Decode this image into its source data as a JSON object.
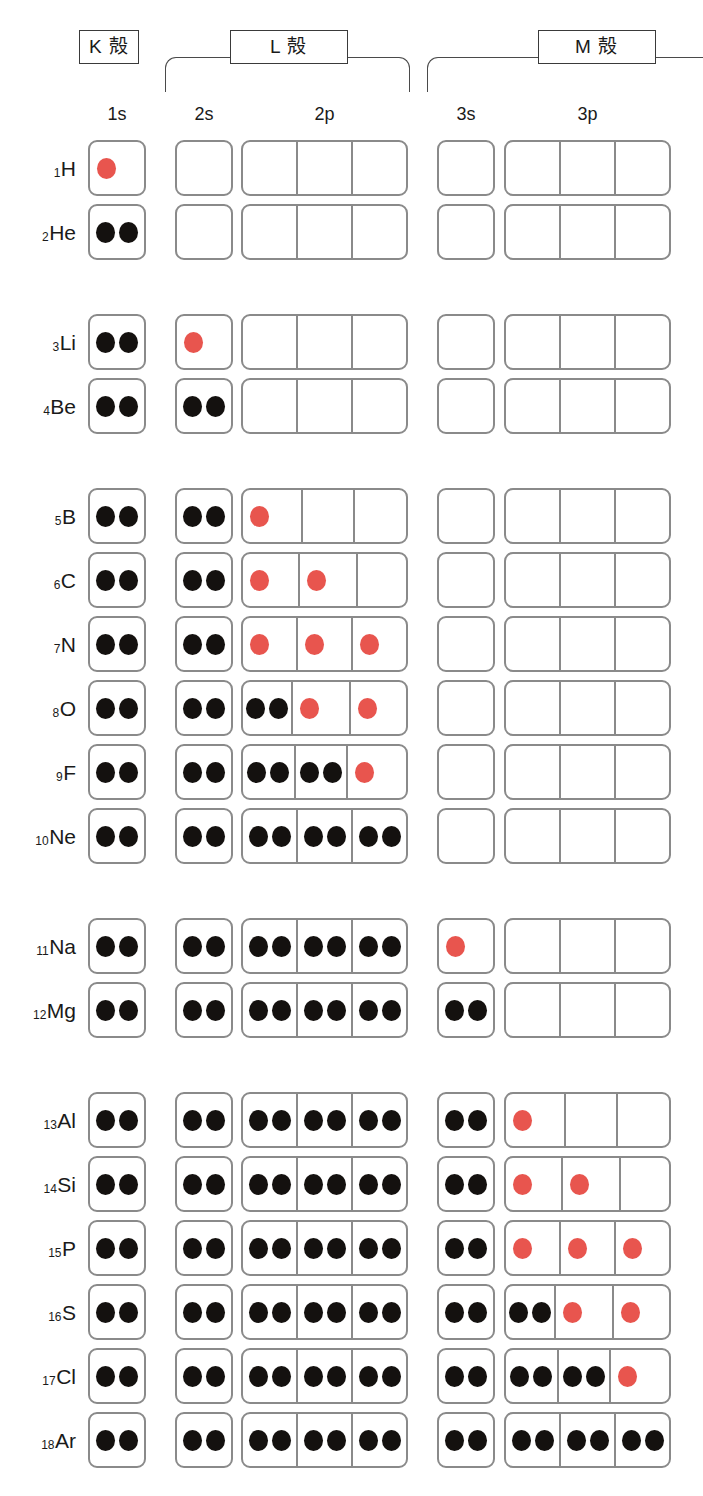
{
  "shells": [
    {
      "id": "k",
      "label": "K 殻",
      "bracket": "none"
    },
    {
      "id": "l",
      "label": "L 殻",
      "bracket": "closed"
    },
    {
      "id": "m",
      "label": "M 殻",
      "bracket": "open-right"
    }
  ],
  "orbitals": [
    {
      "id": "1s",
      "label": "1s",
      "cells": 1
    },
    {
      "id": "2s",
      "label": "2s",
      "cells": 1
    },
    {
      "id": "2p",
      "label": "2p",
      "cells": 3
    },
    {
      "id": "3s",
      "label": "3s",
      "cells": 1
    },
    {
      "id": "3p",
      "label": "3p",
      "cells": 3
    }
  ],
  "colors": {
    "paired_electron": "#14110f",
    "unpaired_electron": "#e8554e",
    "box_border": "#8a8a8a",
    "bracket": "#4a4a4a",
    "label_border": "#3a3a3a",
    "background": "#ffffff"
  },
  "legend": {
    "paired_meaning": "paired electron",
    "unpaired_meaning": "unpaired electron"
  },
  "chart_data": {
    "type": "table",
    "title": "",
    "columns": [
      "1s",
      "2s",
      "2p",
      "3s",
      "3p"
    ],
    "shell_groups": [
      "K 殻",
      "L 殻",
      "M 殻"
    ],
    "electron_states": [
      "paired",
      "unpaired",
      "empty"
    ],
    "rows": [
      {
        "z": "1",
        "symbol": "H",
        "period": 1,
        "orb": {
          "1s": [
            "unpaired"
          ],
          "2s": [],
          "2p": [
            [],
            [],
            []
          ],
          "3s": [],
          "3p": [
            [],
            [],
            []
          ]
        }
      },
      {
        "z": "2",
        "symbol": "He",
        "period": 1,
        "orb": {
          "1s": [
            "paired",
            "paired"
          ],
          "2s": [],
          "2p": [
            [],
            [],
            []
          ],
          "3s": [],
          "3p": [
            [],
            [],
            []
          ]
        }
      },
      {
        "z": "3",
        "symbol": "Li",
        "period": 2,
        "orb": {
          "1s": [
            "paired",
            "paired"
          ],
          "2s": [
            "unpaired"
          ],
          "2p": [
            [],
            [],
            []
          ],
          "3s": [],
          "3p": [
            [],
            [],
            []
          ]
        }
      },
      {
        "z": "4",
        "symbol": "Be",
        "period": 2,
        "orb": {
          "1s": [
            "paired",
            "paired"
          ],
          "2s": [
            "paired",
            "paired"
          ],
          "2p": [
            [],
            [],
            []
          ],
          "3s": [],
          "3p": [
            [],
            [],
            []
          ]
        }
      },
      {
        "z": "5",
        "symbol": "B",
        "period": 3,
        "orb": {
          "1s": [
            "paired",
            "paired"
          ],
          "2s": [
            "paired",
            "paired"
          ],
          "2p": [
            [
              "unpaired"
            ],
            [],
            []
          ],
          "3s": [],
          "3p": [
            [],
            [],
            []
          ]
        }
      },
      {
        "z": "6",
        "symbol": "C",
        "period": 3,
        "orb": {
          "1s": [
            "paired",
            "paired"
          ],
          "2s": [
            "paired",
            "paired"
          ],
          "2p": [
            [
              "unpaired"
            ],
            [
              "unpaired"
            ],
            []
          ],
          "3s": [],
          "3p": [
            [],
            [],
            []
          ]
        }
      },
      {
        "z": "7",
        "symbol": "N",
        "period": 3,
        "orb": {
          "1s": [
            "paired",
            "paired"
          ],
          "2s": [
            "paired",
            "paired"
          ],
          "2p": [
            [
              "unpaired"
            ],
            [
              "unpaired"
            ],
            [
              "unpaired"
            ]
          ],
          "3s": [],
          "3p": [
            [],
            [],
            []
          ]
        }
      },
      {
        "z": "8",
        "symbol": "O",
        "period": 3,
        "orb": {
          "1s": [
            "paired",
            "paired"
          ],
          "2s": [
            "paired",
            "paired"
          ],
          "2p": [
            [
              "paired",
              "paired"
            ],
            [
              "unpaired"
            ],
            [
              "unpaired"
            ]
          ],
          "3s": [],
          "3p": [
            [],
            [],
            []
          ]
        }
      },
      {
        "z": "9",
        "symbol": "F",
        "period": 3,
        "orb": {
          "1s": [
            "paired",
            "paired"
          ],
          "2s": [
            "paired",
            "paired"
          ],
          "2p": [
            [
              "paired",
              "paired"
            ],
            [
              "paired",
              "paired"
            ],
            [
              "unpaired"
            ]
          ],
          "3s": [],
          "3p": [
            [],
            [],
            []
          ]
        }
      },
      {
        "z": "10",
        "symbol": "Ne",
        "period": 3,
        "orb": {
          "1s": [
            "paired",
            "paired"
          ],
          "2s": [
            "paired",
            "paired"
          ],
          "2p": [
            [
              "paired",
              "paired"
            ],
            [
              "paired",
              "paired"
            ],
            [
              "paired",
              "paired"
            ]
          ],
          "3s": [],
          "3p": [
            [],
            [],
            []
          ]
        }
      },
      {
        "z": "11",
        "symbol": "Na",
        "period": 4,
        "orb": {
          "1s": [
            "paired",
            "paired"
          ],
          "2s": [
            "paired",
            "paired"
          ],
          "2p": [
            [
              "paired",
              "paired"
            ],
            [
              "paired",
              "paired"
            ],
            [
              "paired",
              "paired"
            ]
          ],
          "3s": [
            "unpaired"
          ],
          "3p": [
            [],
            [],
            []
          ]
        }
      },
      {
        "z": "12",
        "symbol": "Mg",
        "period": 4,
        "orb": {
          "1s": [
            "paired",
            "paired"
          ],
          "2s": [
            "paired",
            "paired"
          ],
          "2p": [
            [
              "paired",
              "paired"
            ],
            [
              "paired",
              "paired"
            ],
            [
              "paired",
              "paired"
            ]
          ],
          "3s": [
            "paired",
            "paired"
          ],
          "3p": [
            [],
            [],
            []
          ]
        }
      },
      {
        "z": "13",
        "symbol": "Al",
        "period": 5,
        "orb": {
          "1s": [
            "paired",
            "paired"
          ],
          "2s": [
            "paired",
            "paired"
          ],
          "2p": [
            [
              "paired",
              "paired"
            ],
            [
              "paired",
              "paired"
            ],
            [
              "paired",
              "paired"
            ]
          ],
          "3s": [
            "paired",
            "paired"
          ],
          "3p": [
            [
              "unpaired"
            ],
            [],
            []
          ]
        }
      },
      {
        "z": "14",
        "symbol": "Si",
        "period": 5,
        "orb": {
          "1s": [
            "paired",
            "paired"
          ],
          "2s": [
            "paired",
            "paired"
          ],
          "2p": [
            [
              "paired",
              "paired"
            ],
            [
              "paired",
              "paired"
            ],
            [
              "paired",
              "paired"
            ]
          ],
          "3s": [
            "paired",
            "paired"
          ],
          "3p": [
            [
              "unpaired"
            ],
            [
              "unpaired"
            ],
            []
          ]
        }
      },
      {
        "z": "15",
        "symbol": "P",
        "period": 5,
        "orb": {
          "1s": [
            "paired",
            "paired"
          ],
          "2s": [
            "paired",
            "paired"
          ],
          "2p": [
            [
              "paired",
              "paired"
            ],
            [
              "paired",
              "paired"
            ],
            [
              "paired",
              "paired"
            ]
          ],
          "3s": [
            "paired",
            "paired"
          ],
          "3p": [
            [
              "unpaired"
            ],
            [
              "unpaired"
            ],
            [
              "unpaired"
            ]
          ]
        }
      },
      {
        "z": "16",
        "symbol": "S",
        "period": 5,
        "orb": {
          "1s": [
            "paired",
            "paired"
          ],
          "2s": [
            "paired",
            "paired"
          ],
          "2p": [
            [
              "paired",
              "paired"
            ],
            [
              "paired",
              "paired"
            ],
            [
              "paired",
              "paired"
            ]
          ],
          "3s": [
            "paired",
            "paired"
          ],
          "3p": [
            [
              "paired",
              "paired"
            ],
            [
              "unpaired"
            ],
            [
              "unpaired"
            ]
          ]
        }
      },
      {
        "z": "17",
        "symbol": "Cl",
        "period": 5,
        "orb": {
          "1s": [
            "paired",
            "paired"
          ],
          "2s": [
            "paired",
            "paired"
          ],
          "2p": [
            [
              "paired",
              "paired"
            ],
            [
              "paired",
              "paired"
            ],
            [
              "paired",
              "paired"
            ]
          ],
          "3s": [
            "paired",
            "paired"
          ],
          "3p": [
            [
              "paired",
              "paired"
            ],
            [
              "paired",
              "paired"
            ],
            [
              "unpaired"
            ]
          ]
        }
      },
      {
        "z": "18",
        "symbol": "Ar",
        "period": 5,
        "orb": {
          "1s": [
            "paired",
            "paired"
          ],
          "2s": [
            "paired",
            "paired"
          ],
          "2p": [
            [
              "paired",
              "paired"
            ],
            [
              "paired",
              "paired"
            ],
            [
              "paired",
              "paired"
            ]
          ],
          "3s": [
            "paired",
            "paired"
          ],
          "3p": [
            [
              "paired",
              "paired"
            ],
            [
              "paired",
              "paired"
            ],
            [
              "paired",
              "paired"
            ]
          ]
        }
      }
    ]
  },
  "layout": {
    "columns": [
      {
        "id": "1s",
        "x": 88,
        "w": 58
      },
      {
        "id": "2s",
        "x": 175,
        "w": 58
      },
      {
        "id": "2p",
        "x": 241,
        "w": 167
      },
      {
        "id": "3s",
        "x": 437,
        "w": 58
      },
      {
        "id": "3p",
        "x": 504,
        "w": 167
      }
    ],
    "row_height": 56,
    "row_gap": 8,
    "period_gap": 46,
    "first_row_y": 140
  }
}
